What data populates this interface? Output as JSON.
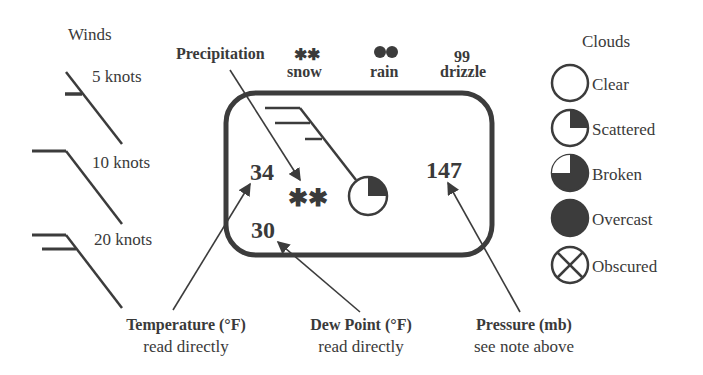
{
  "winds": {
    "title": "Winds",
    "items": [
      {
        "label": "5 knots"
      },
      {
        "label": "10 knots"
      },
      {
        "label": "20 knots"
      }
    ]
  },
  "precipitation": {
    "title": "Precipitation",
    "types": [
      {
        "symbol": "**",
        "label": "snow"
      },
      {
        "symbol": "●●",
        "label": "rain"
      },
      {
        "symbol": "99",
        "label": "drizzle"
      }
    ]
  },
  "station": {
    "temperature": "34",
    "dew_point": "30",
    "pressure": "147",
    "weather_symbol": "**"
  },
  "clouds": {
    "title": "Clouds",
    "items": [
      {
        "label": "Clear"
      },
      {
        "label": "Scattered"
      },
      {
        "label": "Broken"
      },
      {
        "label": "Overcast"
      },
      {
        "label": "Obscured"
      }
    ]
  },
  "callouts": {
    "temperature": {
      "title": "Temperature (°F)",
      "note": "read directly"
    },
    "dew_point": {
      "title": "Dew Point (°F)",
      "note": "read directly"
    },
    "pressure": {
      "title": "Pressure (mb)",
      "note": "see note above"
    }
  },
  "colors": {
    "ink": "#3c3c3c",
    "background": "#ffffff"
  }
}
